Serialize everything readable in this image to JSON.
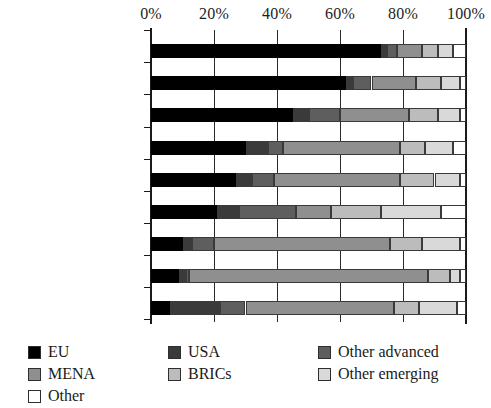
{
  "chart_data": {
    "type": "bar",
    "orientation": "horizontal",
    "stacked": true,
    "normalized_percent": true,
    "title": "",
    "subtitle": "",
    "xlabel": "",
    "ylabel": "",
    "xlim": [
      0,
      100
    ],
    "xticks": [
      0,
      20,
      40,
      60,
      80,
      100
    ],
    "xtick_labels": [
      "0%",
      "20%",
      "40%",
      "60%",
      "80%",
      "100%"
    ],
    "grid": true,
    "grid_axis": "x",
    "legend_position": "bottom",
    "categories": [
      "Tunisia",
      "Morocco",
      "Resource poor",
      "Egypt",
      "Mauritania",
      "MENA",
      "Lebanon",
      "Djibouti",
      "Jordan"
    ],
    "series": [
      {
        "name": "EU",
        "color": "#000000",
        "values": [
          73.0,
          62.0,
          45.0,
          30.0,
          27.0,
          21.0,
          10.0,
          9.0,
          6.0
        ]
      },
      {
        "name": "USA",
        "color": "#3a3a3a",
        "values": [
          2.0,
          2.0,
          5.0,
          7.0,
          5.0,
          7.0,
          3.0,
          2.0,
          16.0
        ]
      },
      {
        "name": "Other advanced",
        "color": "#5e5e5e",
        "values": [
          3.0,
          6.0,
          10.0,
          5.0,
          7.0,
          18.0,
          7.0,
          1.0,
          8.0
        ]
      },
      {
        "name": "MENA",
        "color": "#8f8f8f",
        "values": [
          8.0,
          14.0,
          22.0,
          37.0,
          40.0,
          11.0,
          56.0,
          76.0,
          47.0
        ],
        "note": "mid-grey"
      },
      {
        "name": "BRICs",
        "color": "#bcbcbc",
        "values": [
          5.0,
          8.0,
          9.0,
          8.0,
          11.0,
          16.0,
          10.0,
          7.0,
          8.0
        ]
      },
      {
        "name": "Other emerging",
        "color": "#d9d9d9",
        "values": [
          5.0,
          6.0,
          7.0,
          9.0,
          8.0,
          19.0,
          12.0,
          3.0,
          12.0
        ]
      },
      {
        "name": "Other",
        "color": "#ffffff",
        "values": [
          4.0,
          2.0,
          2.0,
          4.0,
          2.0,
          8.0,
          2.0,
          2.0,
          3.0
        ]
      }
    ]
  },
  "legend": {
    "items": [
      {
        "label": "EU",
        "color": "#000000"
      },
      {
        "label": "MENA",
        "color": "#8f8f8f"
      },
      {
        "label": "Other",
        "color": "#ffffff"
      },
      {
        "label": "USA",
        "color": "#3a3a3a"
      },
      {
        "label": "BRICs",
        "color": "#bcbcbc"
      },
      {
        "label": "Other advanced",
        "color": "#5e5e5e"
      },
      {
        "label": "Other emerging",
        "color": "#d9d9d9"
      }
    ],
    "layout": [
      {
        "key": "EU",
        "col": 0,
        "row": 0
      },
      {
        "key": "MENA",
        "col": 0,
        "row": 1
      },
      {
        "key": "Other",
        "col": 0,
        "row": 2
      },
      {
        "key": "USA",
        "col": 1,
        "row": 0
      },
      {
        "key": "BRICs",
        "col": 1,
        "row": 1
      },
      {
        "key": "Other advanced",
        "col": 2,
        "row": 0
      },
      {
        "key": "Other emerging",
        "col": 2,
        "row": 1
      }
    ]
  }
}
